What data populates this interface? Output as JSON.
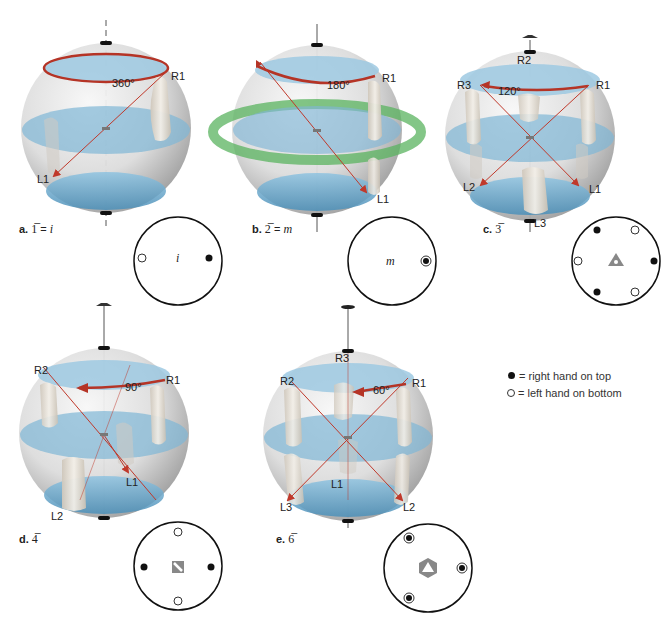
{
  "figure": {
    "legend": {
      "filled": "= right hand on top",
      "open": "= left hand on bottom"
    },
    "panels": [
      {
        "id": "a",
        "caption_letter": "a.",
        "caption_symbol": "1̅",
        "caption_eq": " = ",
        "caption_result": "i",
        "rotation_angle": "360°",
        "hand_labels": [
          "R1",
          "L1"
        ],
        "stereogram_center_label": "i"
      },
      {
        "id": "b",
        "caption_letter": "b.",
        "caption_symbol": "2̅",
        "caption_eq": " = ",
        "caption_result": "m",
        "rotation_angle": "180°",
        "hand_labels": [
          "R1",
          "L1"
        ],
        "stereogram_center_label": "m"
      },
      {
        "id": "c",
        "caption_letter": "c.",
        "caption_symbol": "3̅",
        "rotation_angle": "120°",
        "hand_labels": [
          "R1",
          "R2",
          "R3",
          "L1",
          "L2",
          "L3"
        ]
      },
      {
        "id": "d",
        "caption_letter": "d.",
        "caption_symbol": "4̅",
        "rotation_angle": "90°",
        "hand_labels": [
          "R1",
          "R2",
          "L1",
          "L2"
        ]
      },
      {
        "id": "e",
        "caption_letter": "e.",
        "caption_symbol": "6̅",
        "rotation_angle": "60°",
        "hand_labels": [
          "R1",
          "R2",
          "R3",
          "L1",
          "L2",
          "L3"
        ]
      }
    ],
    "colors": {
      "sphere": "#d9d9d9",
      "plane_blue": "#5fa3c9",
      "mirror_green": "#6cc070",
      "arrow_red": "#c0392b",
      "axis": "#555555"
    }
  }
}
